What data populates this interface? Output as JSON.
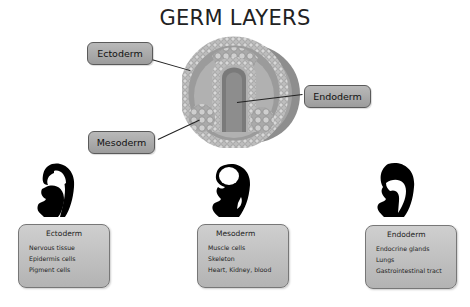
{
  "title": "GERM LAYERS",
  "section_labels": {
    "ectoderm": "Ectoderm",
    "endoderm": "Endoderm",
    "mesoderm": "Mesoderm"
  },
  "boxes": [
    {
      "heading": "Ectoderm",
      "items": [
        "Nervous tissue",
        "Epidermis cells",
        "Pigment cells"
      ]
    },
    {
      "heading": "Mesoderm",
      "items": [
        "Muscle cells",
        "Skeleton",
        "Heart, Kidney, blood"
      ]
    },
    {
      "heading": "Endoderm",
      "items": [
        "Endocrine glands",
        "Lungs",
        "Gastrointestinal tract"
      ]
    }
  ],
  "icons": {
    "cross_section": "embryo-cross-section-illustration",
    "fetus": "fetus-silhouette"
  },
  "colors": {
    "label_fill": "#a9a9a9",
    "box_fill": "#c2c2c2",
    "outline": "#5a5a5a",
    "silhouette": "#000000"
  }
}
